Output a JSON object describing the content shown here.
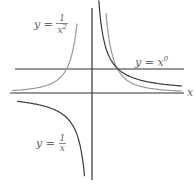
{
  "diagram": {
    "x_axis_label": "x",
    "labels": {
      "inv_sq": {
        "lhs": "y =",
        "num": "1",
        "den": "x",
        "exp": "2"
      },
      "x_zero": {
        "lhs": "y = x",
        "exp": "0"
      },
      "inv": {
        "lhs": "y =",
        "num": "1",
        "den": "x"
      }
    },
    "colors": {
      "axis": "#333333",
      "dark_curve": "#3a3a3a",
      "light_curve": "#9a9a9a",
      "label": "#666666"
    }
  },
  "chart_data": {
    "type": "line",
    "title": "",
    "xlabel": "x",
    "ylabel": "",
    "grid": false,
    "series": [
      {
        "name": "y = 1/x^2",
        "color": "#9a9a9a"
      },
      {
        "name": "y = x^0",
        "color": "#333333",
        "value": 1
      },
      {
        "name": "y = 1/x",
        "color": "#3a3a3a"
      }
    ]
  }
}
